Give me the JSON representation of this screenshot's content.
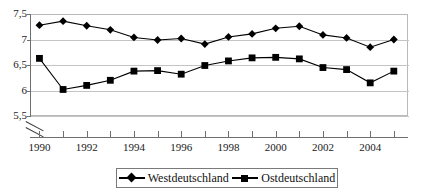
{
  "chart_data": {
    "type": "line",
    "title": "",
    "xlabel": "",
    "ylabel": "",
    "x": [
      1990,
      1991,
      1992,
      1993,
      1994,
      1995,
      1996,
      1997,
      1998,
      1999,
      2000,
      2001,
      2002,
      2003,
      2004,
      2005
    ],
    "xlim": [
      1989.6,
      2005.6
    ],
    "ylim": [
      5.5,
      7.5
    ],
    "y_ticks": [
      5.5,
      6.0,
      6.5,
      7.0,
      7.5
    ],
    "y_tick_labels": [
      "5,5",
      "6",
      "6,5",
      "7",
      "7,5"
    ],
    "x_tick_labels": [
      "1990",
      "",
      "1992",
      "",
      "1994",
      "",
      "1996",
      "",
      "1998",
      "",
      "2000",
      "",
      "2002",
      "",
      "2004",
      ""
    ],
    "grid": true,
    "axis_break": true,
    "legend_position": "bottom",
    "series": [
      {
        "name": "Westdeutschland",
        "marker": "diamond",
        "color": "#000000",
        "values": [
          7.28,
          7.36,
          7.27,
          7.19,
          7.04,
          6.99,
          7.02,
          6.91,
          7.05,
          7.11,
          7.22,
          7.26,
          7.09,
          7.03,
          6.85,
          7.0
        ]
      },
      {
        "name": "Ostdeutschland",
        "marker": "square",
        "color": "#000000",
        "values": [
          6.63,
          6.02,
          6.1,
          6.2,
          6.38,
          6.39,
          6.32,
          6.49,
          6.58,
          6.64,
          6.65,
          6.62,
          6.45,
          6.41,
          6.15,
          6.38
        ]
      }
    ]
  },
  "legend": {
    "entries": [
      {
        "label": "Westdeutschland",
        "marker": "diamond-marker-icon"
      },
      {
        "label": "Ostdeutschland",
        "marker": "square-marker-icon"
      }
    ]
  }
}
